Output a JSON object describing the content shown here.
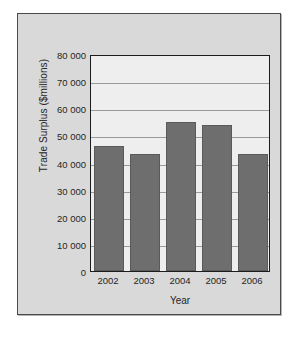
{
  "chart_data": {
    "type": "bar",
    "title": "",
    "xlabel": "Year",
    "ylabel": "Trade Surplus ($millions)",
    "categories": [
      "2002",
      "2003",
      "2004",
      "2005",
      "2006"
    ],
    "values": [
      46000,
      43000,
      55000,
      54000,
      43000
    ],
    "series": [
      {
        "name": "Trade Surplus",
        "values": [
          46000,
          43000,
          55000,
          54000,
          43000
        ]
      }
    ],
    "ylim": [
      0,
      80000
    ],
    "ytick_values": [
      0,
      10000,
      20000,
      30000,
      40000,
      50000,
      60000,
      70000,
      80000
    ],
    "ytick_labels": [
      "0",
      "10 000",
      "20 000",
      "30 000",
      "40 000",
      "50 000",
      "60 000",
      "70 000",
      "80 000"
    ],
    "grid": true,
    "grid_axis": "y",
    "legend": false,
    "legend_position": "none",
    "colors": {
      "bar_fill": "#6e6e6e",
      "bar_edge": "#5a5a5a",
      "plot_background": "#eeeeee",
      "card_background": "#d9d9d9",
      "gridline": "#9a9a9a",
      "axis_line": "#1c1c1c",
      "text": "#1f1f1f"
    }
  }
}
